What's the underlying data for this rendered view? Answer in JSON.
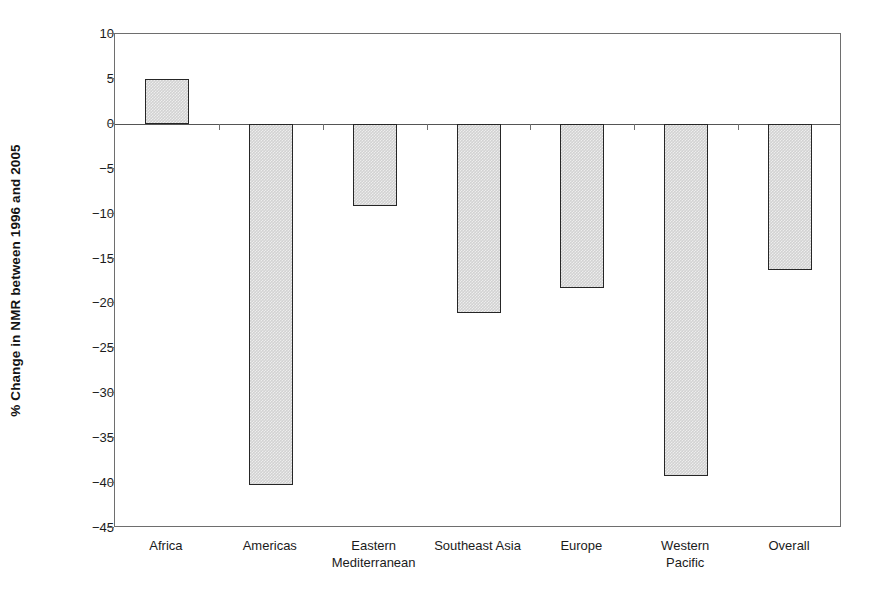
{
  "chart_data": {
    "type": "bar",
    "title": "",
    "subtitle": "",
    "xlabel": "",
    "ylabel": "% Change in NMR between 1996 and 2005",
    "categories": [
      "Africa",
      "Americas",
      "Eastern\nMediterranean",
      "Southeast Asia",
      "Europe",
      "Western\nPacific",
      "Overall"
    ],
    "values": [
      5.0,
      -40.2,
      -9.1,
      -21.1,
      -18.3,
      -39.2,
      -16.3
    ],
    "ylim": [
      -45,
      10
    ],
    "ytick_labels": [
      "10",
      "5",
      "0",
      "−5",
      "−10",
      "−15",
      "−20",
      "−25",
      "−30",
      "−35",
      "−40",
      "−45"
    ],
    "ytick_values": [
      10,
      5,
      0,
      -5,
      -10,
      -15,
      -20,
      -25,
      -30,
      -35,
      -40,
      -45
    ],
    "grid": false,
    "legend": null,
    "legend_position": "none",
    "bar_fill_color": "#d2d2d2",
    "bar_border_color": "#262626",
    "axis_color": "#6e6e6e",
    "background_color": "#ffffff"
  },
  "axes": {
    "y_title": "% Change in NMR between 1996 and 2005"
  }
}
